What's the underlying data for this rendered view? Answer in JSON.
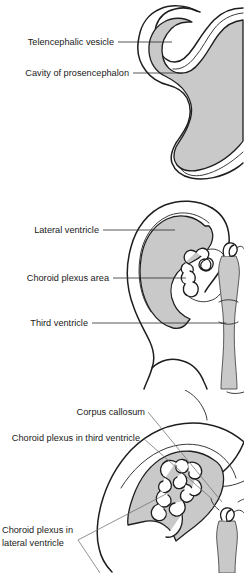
{
  "figure": {
    "background_color": "#ffffff",
    "tissue_fill_color": "#c9c9c9",
    "outline_color": "#1e1e1e",
    "plexus_fill_color": "#ffffff",
    "panel_count": 3
  },
  "panels": [
    {
      "id": "panel-top",
      "stage": "early",
      "labels": [
        {
          "id": "telencephalic-vesicle",
          "text": "Telencephalic vesicle"
        },
        {
          "id": "cavity-of-prosencephalon",
          "text": "Cavity of prosencephalon"
        }
      ]
    },
    {
      "id": "panel-middle",
      "stage": "intermediate",
      "labels": [
        {
          "id": "lateral-ventricle",
          "text": "Lateral ventricle"
        },
        {
          "id": "choroid-plexus-area",
          "text": "Choroid plexus area"
        },
        {
          "id": "third-ventricle",
          "text": "Third ventricle"
        }
      ]
    },
    {
      "id": "panel-bottom",
      "stage": "late",
      "labels": [
        {
          "id": "corpus-callosum",
          "text": "Corpus callosum"
        },
        {
          "id": "choroid-plexus-third-ventricle",
          "text": "Choroid plexus in third ventricle"
        },
        {
          "id": "choroid-plexus-lateral-ventricle-line1",
          "text": "Choroid plexus in"
        },
        {
          "id": "choroid-plexus-lateral-ventricle-line2",
          "text": "lateral ventricle"
        }
      ]
    }
  ]
}
